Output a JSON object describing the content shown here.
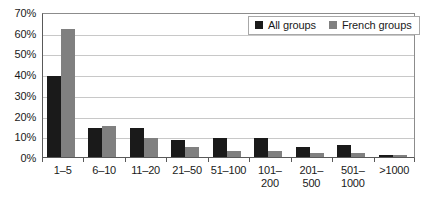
{
  "chart_data": {
    "type": "bar",
    "title": "",
    "subtitle": "",
    "xlabel": "",
    "ylabel": "",
    "categories": [
      "1–5",
      "6–10",
      "11–20",
      "21–50",
      "51–100",
      "101–\n200",
      "201–\n500",
      "501–\n1000",
      ">1000"
    ],
    "category_lines": [
      [
        "1–5"
      ],
      [
        "6–10"
      ],
      [
        "11–20"
      ],
      [
        "21–50"
      ],
      [
        "51–100"
      ],
      [
        "101–",
        "200"
      ],
      [
        "201–",
        "500"
      ],
      [
        "501–",
        "1000"
      ],
      [
        ">1000"
      ]
    ],
    "series": [
      {
        "name": "All groups",
        "color": "#1a1a1a",
        "values": [
          39,
          14,
          14,
          8,
          9,
          9,
          5,
          6,
          1
        ]
      },
      {
        "name": "French groups",
        "color": "#808080",
        "values": [
          62,
          15,
          9,
          5,
          3,
          3,
          2,
          2,
          1
        ]
      }
    ],
    "ylim": [
      0,
      70
    ],
    "ytick_step": 10,
    "ytick_labels": [
      "0%",
      "10%",
      "20%",
      "30%",
      "40%",
      "50%",
      "60%",
      "70%"
    ],
    "ytick_values": [
      0,
      10,
      20,
      30,
      40,
      50,
      60,
      70
    ],
    "grid": true,
    "grid_axis": "y",
    "legend_position": "top-right",
    "value_suffix": "%"
  },
  "legend": {
    "items": [
      {
        "label": "All groups",
        "color": "#1a1a1a"
      },
      {
        "label": "French groups",
        "color": "#808080"
      }
    ]
  },
  "colors": {
    "series_all_groups": "#1a1a1a",
    "series_french_groups": "#808080",
    "gridline": "#c8c8c8",
    "axis": "#595959",
    "plot_border": "#8c8c8c",
    "background": "#ffffff",
    "text": "#1a1a1a"
  }
}
